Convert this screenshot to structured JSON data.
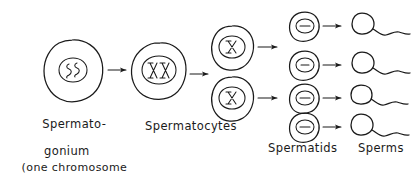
{
  "diagram": {
    "style": "hand-drawn ink sketch on white paper",
    "ink_color": "#1a1a1a",
    "background_color": "#ffffff",
    "labels": {
      "spermatogonium_line1": "Spermato-",
      "spermatogonium_line2": "gonium",
      "note_line1": "(one chromosome",
      "note_line2": "pair shown )",
      "spermatocytes": "Spermatocytes",
      "spermatids": "Spermatids",
      "sperms": "Sperms"
    },
    "stages": [
      {
        "name": "spermatogonium",
        "count": 1,
        "nucleus_contents": "two squiggle chromosomes",
        "glyph": "SS"
      },
      {
        "name": "primary-spermatocyte",
        "count": 1,
        "nucleus_contents": "duplicated chromosome pair",
        "glyph": "XX"
      },
      {
        "name": "secondary-spermatocytes",
        "count": 2,
        "nucleus_contents": "single chromosome",
        "glyph": "X"
      },
      {
        "name": "spermatids",
        "count": 4,
        "nucleus_contents": "single chromatid dash",
        "glyph": "-"
      },
      {
        "name": "sperms",
        "count": 4,
        "nucleus_contents": "head with flagellum tail",
        "glyph": "tail"
      }
    ],
    "arrows": [
      {
        "from": "spermatogonium",
        "to": "primary-spermatocyte"
      },
      {
        "from": "primary-spermatocyte",
        "to": "secondary-spermatocytes"
      },
      {
        "from": "secondary-spermatocyte-1",
        "to": "spermatid-1"
      },
      {
        "from": "secondary-spermatocyte-2",
        "to": "spermatid-3"
      },
      {
        "from": "spermatid-1",
        "to": "sperm-1"
      },
      {
        "from": "spermatid-2",
        "to": "sperm-2"
      },
      {
        "from": "spermatid-3",
        "to": "sperm-3"
      },
      {
        "from": "spermatid-4",
        "to": "sperm-4"
      }
    ]
  }
}
